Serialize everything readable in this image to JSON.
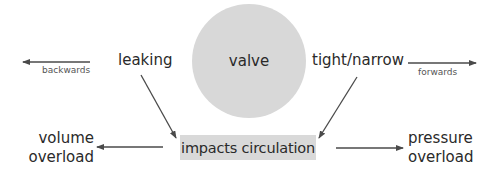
{
  "diagram": {
    "center_node": {
      "label": "valve",
      "shape": "circle",
      "fill": "#d8d8d8"
    },
    "left_branch": {
      "label": "leaking",
      "direction_label": "backwards",
      "result_line1": "volume",
      "result_line2": "overload"
    },
    "right_branch": {
      "label": "tight/narrow",
      "direction_label": "forwards",
      "result_line1": "pressure",
      "result_line2": "overload"
    },
    "impact_node": {
      "label": "impacts circulation",
      "shape": "rectangle",
      "fill": "#d9d9d9"
    },
    "edges": [
      {
        "from": "leaking",
        "to": "backwards",
        "label": "backwards"
      },
      {
        "from": "tight/narrow",
        "to": "forwards",
        "label": "forwards"
      },
      {
        "from": "leaking",
        "to": "impacts circulation"
      },
      {
        "from": "tight/narrow",
        "to": "impacts circulation"
      },
      {
        "from": "impacts circulation",
        "to": "volume overload"
      },
      {
        "from": "impacts circulation",
        "to": "pressure overload"
      }
    ],
    "colors": {
      "arrow": "#4a4a4a",
      "text": "#2a2a2a"
    }
  }
}
